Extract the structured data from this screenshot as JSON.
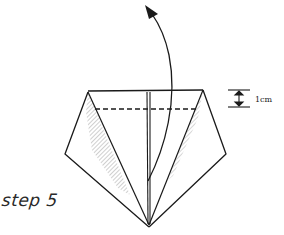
{
  "diagram": {
    "step_label": "step 5",
    "measurement": {
      "label": "1cm",
      "icon": "double-arrow-measure-icon"
    },
    "fold_line": "dashed-valley-fold",
    "action": "fold top edge up along dashed line",
    "arrow_icon": "curved-arrow-up-icon",
    "colors": {
      "ink": "#1a1a1a",
      "background": "#ffffff",
      "hatch": "#555555"
    }
  }
}
